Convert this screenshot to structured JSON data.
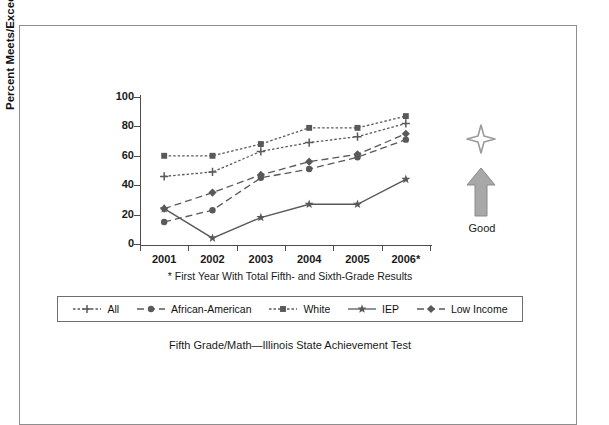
{
  "caption": "Fifth Grade/Math—Illinois State Achievement Test",
  "footnote": "* First Year With Total Fifth- and Sixth-Grade Results",
  "good_indicator": {
    "label": "Good",
    "arrow_icon": "up-arrow-icon",
    "star_icon": "star-icon",
    "arrow_color": "#a6a6a6"
  },
  "chart_data": {
    "type": "line",
    "title": "Fifth Grade/Math—Illinois State Achievement Test",
    "xlabel": "",
    "ylabel": "Percent Meets/Exceeds",
    "categories": [
      "2001",
      "2002",
      "2003",
      "2004",
      "2005",
      "2006*"
    ],
    "ylim": [
      0,
      100
    ],
    "yticks": [
      0,
      20,
      40,
      60,
      80,
      100
    ],
    "grid": false,
    "legend_position": "bottom",
    "series": [
      {
        "name": "All",
        "marker": "plus",
        "line": "dotted",
        "values": [
          46,
          49,
          63,
          69,
          73,
          82
        ]
      },
      {
        "name": "African-American",
        "marker": "circle",
        "line": "dashed",
        "values": [
          15,
          23,
          45,
          51,
          59,
          71
        ]
      },
      {
        "name": "White",
        "marker": "square",
        "line": "dotted",
        "values": [
          60,
          60,
          68,
          79,
          79,
          87
        ]
      },
      {
        "name": "IEP",
        "marker": "star",
        "line": "solid",
        "values": [
          24,
          4,
          18,
          27,
          27,
          44
        ]
      },
      {
        "name": "Low Income",
        "marker": "diamond",
        "line": "dashed",
        "values": [
          24,
          35,
          47,
          56,
          61,
          75
        ]
      }
    ]
  },
  "legend": {
    "items": [
      {
        "label": "All",
        "marker": "plus-marker-icon"
      },
      {
        "label": "African-American",
        "marker": "circle-marker-icon"
      },
      {
        "label": "White",
        "marker": "square-marker-icon"
      },
      {
        "label": "IEP",
        "marker": "star-marker-icon"
      },
      {
        "label": "Low Income",
        "marker": "diamond-marker-icon"
      }
    ]
  }
}
